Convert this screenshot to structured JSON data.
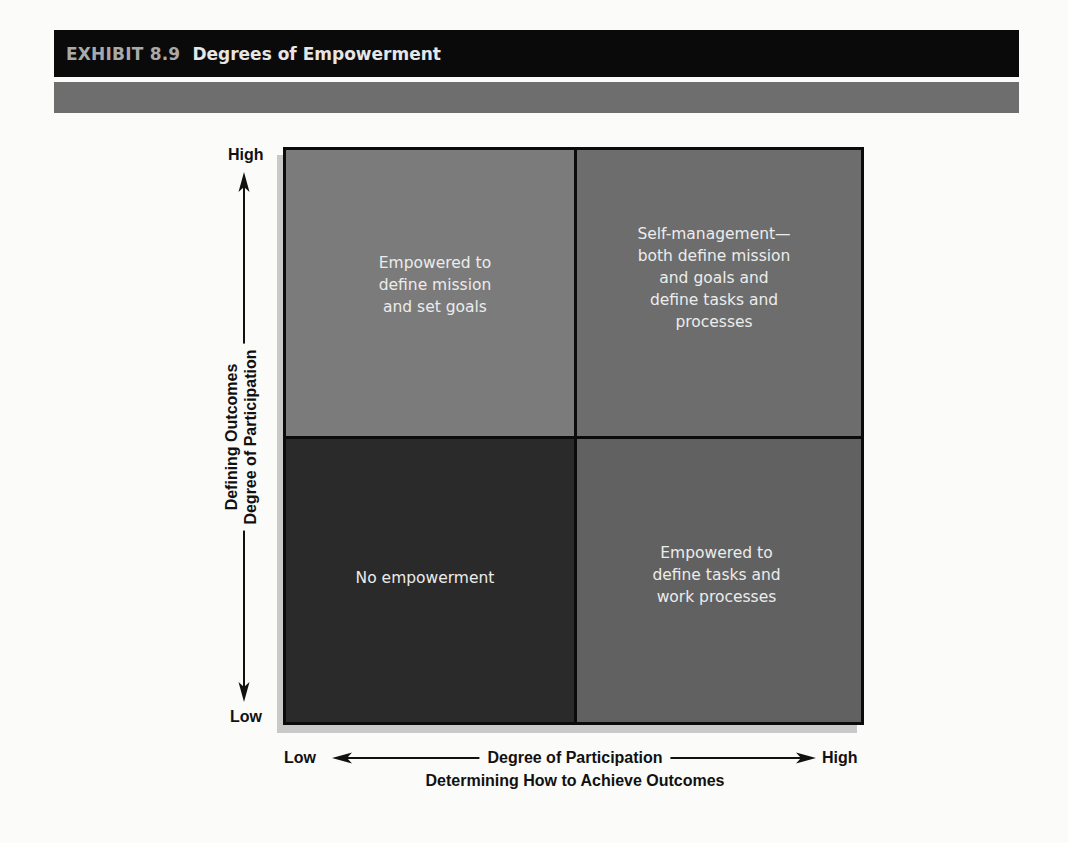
{
  "header": {
    "exhibit_number": "EXHIBIT 8.9",
    "title": "Degrees of Empowerment"
  },
  "diagram": {
    "type": "2x2-matrix",
    "y_axis": {
      "high_label": "High",
      "low_label": "Low",
      "title_line1": "Defining Outcomes",
      "title_line2": "Degree of Participation"
    },
    "x_axis": {
      "low_label": "Low",
      "high_label": "High",
      "title": "Degree of Participation",
      "subtitle": "Determining How to Achieve Outcomes"
    },
    "quadrants": {
      "top_left": {
        "text": "Empowered to\ndefine mission\nand set goals",
        "color": "#7b7b7b"
      },
      "top_right": {
        "text": "Self-management—\nboth define mission\nand goals and\ndefine tasks and\nprocesses",
        "color": "#6d6d6d"
      },
      "bottom_left": {
        "text": "No empowerment",
        "color": "#2a2a2a"
      },
      "bottom_right": {
        "text": "Empowered to\ndefine tasks and\nwork processes",
        "color": "#616161"
      }
    }
  }
}
